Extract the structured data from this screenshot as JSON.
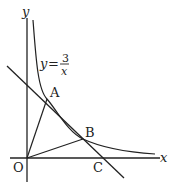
{
  "diagram": {
    "curve_label": {
      "y": "y",
      "eq": "=",
      "num": "3",
      "den": "x"
    },
    "axes": {
      "x": "x",
      "y": "y"
    },
    "points": {
      "O": "O",
      "A": "A",
      "B": "B",
      "C": "C"
    }
  }
}
